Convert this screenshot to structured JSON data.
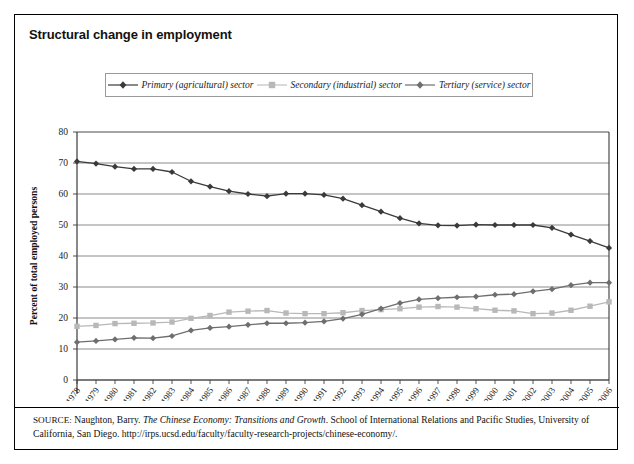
{
  "figure": {
    "title": "Structural change in employment",
    "source": {
      "prefix": "SOURCE",
      "author": "Naughton, Barry.",
      "work_italic": "The Chinese Economy: Transitions and Growth",
      "publisher": "School of International Relations and Pacific Studies, University of California, San Diego.",
      "url": "http://irps.ucsd.edu/faculty/faculty-research-projects/chinese-economy/."
    }
  },
  "legend": {
    "position": "top-center",
    "items": [
      {
        "label": "Primary (agricultural) sector",
        "marker": "diamond",
        "color": "#3a3a3a"
      },
      {
        "label": "Secondary (industrial) sector",
        "marker": "square",
        "color": "#b8b8b8"
      },
      {
        "label": "Tertiary (service) sector",
        "marker": "diamond",
        "color": "#6e6e6e"
      }
    ]
  },
  "chart_data": {
    "type": "line",
    "title": "Structural change in employment",
    "xlabel": "",
    "ylabel": "Percent of total employed persons",
    "ylim": [
      0,
      80
    ],
    "ytick_step": 10,
    "yticks": [
      0,
      10,
      20,
      30,
      40,
      50,
      60,
      70,
      80
    ],
    "grid": true,
    "legend_position": "top-center",
    "categories": [
      "1978",
      "1979",
      "1980",
      "1981",
      "1982",
      "1983",
      "1984",
      "1985",
      "1986",
      "1987",
      "1988",
      "1989",
      "1990",
      "1991",
      "1992",
      "1993",
      "1994",
      "1995",
      "1996",
      "1997",
      "1998",
      "1999",
      "2000",
      "2001",
      "2002",
      "2003",
      "2004",
      "2005",
      "2006"
    ],
    "series": [
      {
        "name": "Primary (agricultural) sector",
        "color": "#3a3a3a",
        "marker": "diamond",
        "values": [
          70.5,
          69.8,
          68.8,
          68.1,
          68.1,
          67.1,
          64.1,
          62.4,
          60.9,
          60.0,
          59.3,
          60.1,
          60.1,
          59.7,
          58.5,
          56.4,
          54.3,
          52.2,
          50.5,
          49.9,
          49.8,
          50.1,
          50.0,
          50.0,
          50.0,
          49.1,
          46.9,
          44.8,
          42.6
        ]
      },
      {
        "name": "Secondary (industrial) sector",
        "color": "#b8b8b8",
        "marker": "square",
        "values": [
          17.3,
          17.6,
          18.2,
          18.3,
          18.4,
          18.7,
          19.9,
          20.8,
          21.9,
          22.2,
          22.4,
          21.6,
          21.4,
          21.4,
          21.7,
          22.4,
          22.7,
          23.0,
          23.5,
          23.7,
          23.5,
          23.0,
          22.5,
          22.3,
          21.4,
          21.6,
          22.5,
          23.8,
          25.2
        ]
      },
      {
        "name": "Tertiary (service) sector",
        "color": "#6e6e6e",
        "marker": "diamond",
        "values": [
          12.2,
          12.6,
          13.1,
          13.6,
          13.5,
          14.2,
          16.0,
          16.8,
          17.2,
          17.8,
          18.3,
          18.3,
          18.5,
          18.9,
          19.8,
          21.2,
          23.0,
          24.8,
          26.0,
          26.4,
          26.7,
          26.9,
          27.5,
          27.7,
          28.6,
          29.3,
          30.6,
          31.4,
          31.4
        ]
      }
    ]
  }
}
